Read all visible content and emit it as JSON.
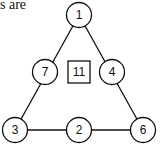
{
  "caption": "s are",
  "diagram": {
    "type": "triangle-number-puzzle",
    "center_value": "11",
    "nodes": [
      {
        "id": "top",
        "label": "1",
        "x": 79,
        "y": 15
      },
      {
        "id": "left-mid",
        "label": "7",
        "x": 45,
        "y": 72
      },
      {
        "id": "right-mid",
        "label": "4",
        "x": 112,
        "y": 72
      },
      {
        "id": "bottom-left",
        "label": "3",
        "x": 15,
        "y": 130
      },
      {
        "id": "bottom-mid",
        "label": "2",
        "x": 79,
        "y": 130
      },
      {
        "id": "bottom-right",
        "label": "6",
        "x": 143,
        "y": 130
      }
    ],
    "colors": {
      "stroke": "#111111",
      "fill": "#ffffff"
    }
  }
}
